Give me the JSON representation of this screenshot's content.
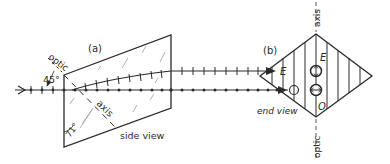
{
  "figure": {
    "panel_a": {
      "label": "(a)",
      "caption": "side view",
      "optic_label": "optic",
      "axis_label": "axis",
      "angle_45": "45°",
      "angle_71": "71°"
    },
    "panel_b": {
      "label": "(b)",
      "caption": "end view",
      "axis_label": "axis",
      "optic_label": "optic",
      "e_label": "E",
      "o_label": "O"
    },
    "rays": {
      "e_ray_label": "E",
      "o_ray_label": "O"
    },
    "colors": {
      "ink": "#2a2a2a",
      "hatch": "#8a8a8a",
      "background": "#ffffff"
    }
  }
}
